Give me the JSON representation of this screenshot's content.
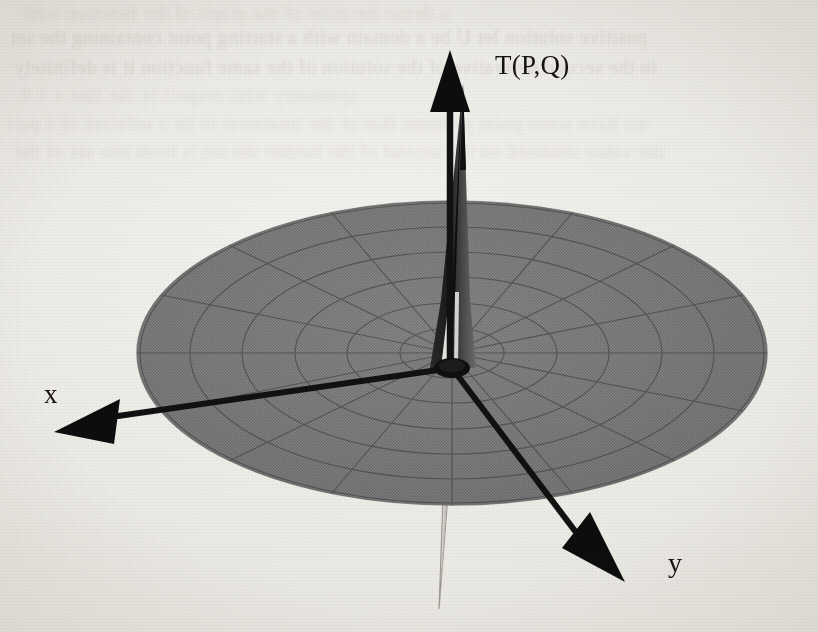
{
  "figure": {
    "kind": "3d-surface-plot",
    "background_color": "#f0eee9",
    "ink_color": "#14120f",
    "surface_color": "#7d7d7d",
    "mesh_color": "#4a4a4a",
    "highlight_color": "#f2f0ec"
  },
  "axes": {
    "vertical": {
      "name": "vertical-axis",
      "label": "T(P,Q)",
      "direction": "up",
      "arrow_tip": {
        "x": 450,
        "y": 52
      },
      "origin": {
        "x": 452,
        "y": 368
      }
    },
    "x": {
      "name": "x-axis",
      "label": "x",
      "direction": "down-left",
      "arrow_tip": {
        "x": 55,
        "y": 433
      },
      "origin": {
        "x": 452,
        "y": 368
      }
    },
    "y": {
      "name": "y-axis",
      "label": "y",
      "direction": "down-right",
      "arrow_tip": {
        "x": 624,
        "y": 581
      },
      "origin": {
        "x": 452,
        "y": 368
      }
    }
  },
  "surface": {
    "domain_shape": "disk",
    "mesh_type": "polar",
    "radial_spokes": 16,
    "concentric_rings": 6,
    "center": {
      "x": 452,
      "y": 353
    },
    "radius_x": 315,
    "radius_y": 152,
    "fill": "#7d7d7d"
  },
  "spike": {
    "name": "central-spike",
    "direction": "up",
    "apex": {
      "x": 463,
      "y": 84
    },
    "base_half_width": 16,
    "base_y": 368,
    "highlight": "left-facing-white-sliver"
  },
  "lower_spike": {
    "name": "lower-spike",
    "direction": "down",
    "apex": {
      "x": 438,
      "y": 610
    },
    "emerges_at_y": 505
  },
  "chart_data": {
    "type": "surface",
    "title": "T(P,Q)",
    "xlabel": "x",
    "ylabel": "y",
    "zlabel": "T(P,Q)",
    "domain": "disk of radius R centered at origin",
    "mesh": {
      "radial_spokes": 16,
      "concentric_rings": 6,
      "coordinates": "polar"
    },
    "features": [
      "flat near-zero plateau across the entire disk",
      "single sharp singular spike at the origin rising far above the plateau",
      "thin mirrored spike descending below the plate at the origin"
    ],
    "legend": "none",
    "grid": true
  },
  "bleed_text": {
    "lines": [
      {
        "text": "a dense iteration of the graph of the function with",
        "x": 22,
        "y": 2,
        "size": 20,
        "class": "vfaint"
      },
      {
        "text": "positive solution let U be a domain with a starting point containing the set",
        "x": 10,
        "y": 26,
        "size": 20,
        "class": "faint"
      },
      {
        "text": "in the second derivative of the solution of the same function it is definitely",
        "x": 14,
        "y": 56,
        "size": 20,
        "class": "faint"
      },
      {
        "text": "symmetry with respect to the line x = 0",
        "x": 20,
        "y": 84,
        "size": 20,
        "class": "vfaint"
      },
      {
        "text": "we have some point problem that of the treatment to be a solution of a part",
        "x": 6,
        "y": 112,
        "size": 20,
        "class": "vfaint"
      },
      {
        "text": "the value obtained on the second of the further the set is from one set of the",
        "x": 14,
        "y": 140,
        "size": 20,
        "class": "vfaint"
      }
    ]
  }
}
